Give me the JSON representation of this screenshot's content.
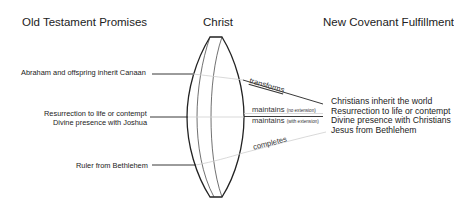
{
  "headers": {
    "left": "Old Testament Promises",
    "center": "Christ",
    "right": "New Covenant Fulfillment"
  },
  "old_testament_promises": [
    "Abraham and offspring inherit Canaan",
    "Resurrection to life or contempt",
    "Divine presence with Joshua",
    "Ruler from Bethlehem"
  ],
  "new_covenant_fulfillments": [
    "Christians inherit the world",
    "Resurrection to life or contempt",
    "Divine presence with Christians",
    "Jesus from Bethlehem"
  ],
  "relations": [
    {
      "verb": "transforms",
      "qualifier": ""
    },
    {
      "verb": "maintains",
      "qualifier": "(no extension)"
    },
    {
      "verb": "maintains",
      "qualifier": "(with extension)"
    },
    {
      "verb": "completes",
      "qualifier": ""
    }
  ],
  "colors": {
    "line_dark": "#222222",
    "line_light": "#c8c8c8",
    "text": "#222222"
  }
}
